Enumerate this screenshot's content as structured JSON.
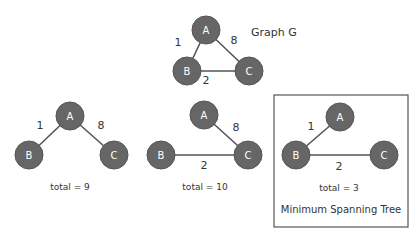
{
  "graph_g": {
    "title": "Graph G",
    "nodes": {
      "A": "A",
      "B": "B",
      "C": "C"
    },
    "edges": [
      {
        "from": "A",
        "to": "B",
        "weight": "1"
      },
      {
        "from": "A",
        "to": "C",
        "weight": "8"
      },
      {
        "from": "B",
        "to": "C",
        "weight": "2"
      }
    ]
  },
  "tree1": {
    "nodes": {
      "A": "A",
      "B": "B",
      "C": "C"
    },
    "edges": [
      {
        "from": "A",
        "to": "B",
        "weight": "1"
      },
      {
        "from": "A",
        "to": "C",
        "weight": "8"
      }
    ],
    "total": "total = 9"
  },
  "tree2": {
    "nodes": {
      "A": "A",
      "B": "B",
      "C": "C"
    },
    "edges": [
      {
        "from": "A",
        "to": "C",
        "weight": "8"
      },
      {
        "from": "B",
        "to": "C",
        "weight": "2"
      }
    ],
    "total": "total = 10"
  },
  "tree3": {
    "nodes": {
      "A": "A",
      "B": "B",
      "C": "C"
    },
    "edges": [
      {
        "from": "A",
        "to": "B",
        "weight": "1"
      },
      {
        "from": "B",
        "to": "C",
        "weight": "2"
      }
    ],
    "total": "total = 3",
    "caption": "Minimum Spanning Tree"
  }
}
